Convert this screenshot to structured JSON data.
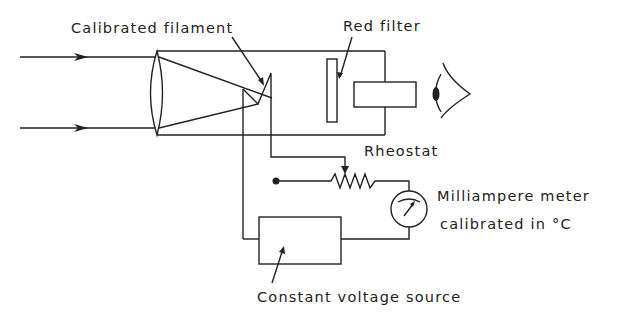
{
  "diagram": {
    "labels": {
      "filament": "Calibrated filament",
      "filter": "Red filter",
      "rheostat": "Rheostat",
      "meter_line1": "Milliampere meter",
      "meter_line2": "calibrated in °C",
      "source": "Constant voltage source"
    },
    "components": [
      {
        "name": "incoming-light-rays",
        "count": 2
      },
      {
        "name": "objective-lens"
      },
      {
        "name": "pyrometer-tube"
      },
      {
        "name": "calibrated-filament"
      },
      {
        "name": "red-filter"
      },
      {
        "name": "eyepiece"
      },
      {
        "name": "observer-eye"
      },
      {
        "name": "rheostat"
      },
      {
        "name": "milliampere-meter"
      },
      {
        "name": "constant-voltage-source"
      }
    ],
    "colors": {
      "line": "#222222",
      "background": "#ffffff"
    }
  }
}
